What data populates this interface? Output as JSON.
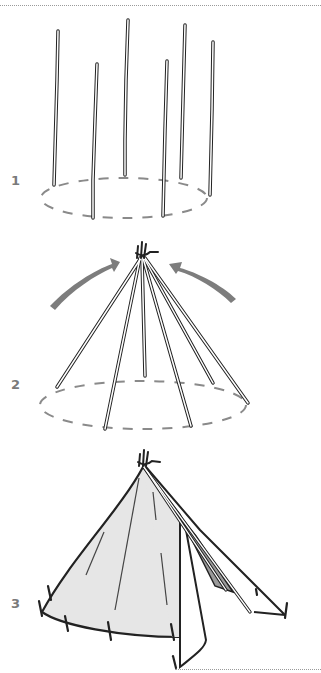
{
  "figure": {
    "colors": {
      "line": "#222222",
      "pole_fill": "#ffffff",
      "dashed_circle": "#8a8a8a",
      "arrow": "#7d7d7d",
      "canvas_fill": "#e6e6e6",
      "inner_shadow": "#9a9a9a",
      "step_number": "#7a7a7a"
    },
    "steps": [
      {
        "number": "1",
        "description": "Six poles standing upright around a dashed circle"
      },
      {
        "number": "2",
        "description": "Poles leaned inward and tied at the top, arrows showing inward motion"
      },
      {
        "number": "3",
        "description": "Canvas wrapped around tied poles and pegged to the ground with door flap open"
      }
    ]
  }
}
